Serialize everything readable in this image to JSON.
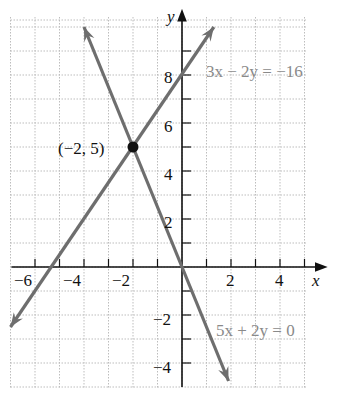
{
  "chart_data": {
    "type": "line",
    "title": "",
    "xlabel": "x",
    "ylabel": "y",
    "xlim": [
      -7,
      5
    ],
    "ylim": [
      -5,
      10
    ],
    "grid": true,
    "x_ticks": [
      -6,
      -4,
      -2,
      2,
      4
    ],
    "y_ticks": [
      -4,
      -2,
      2,
      4,
      6,
      8
    ],
    "series": [
      {
        "name": "3x − 2y = −16",
        "equation": "y = 1.5x + 8",
        "points": [
          [
            -7,
            -2.5
          ],
          [
            1.3,
            10
          ]
        ]
      },
      {
        "name": "5x + 2y = 0",
        "equation": "y = -2.5x",
        "points": [
          [
            -4,
            10
          ],
          [
            1.9,
            -4.75
          ]
        ]
      }
    ],
    "annotations": [
      {
        "text": "(−2, 5)",
        "x": -2,
        "y": 5,
        "marker": "point"
      }
    ]
  },
  "labels": {
    "x_axis": "x",
    "y_axis": "y",
    "eq1": "3x − 2y = −16",
    "eq2": "5x + 2y = 0",
    "point": "(−2, 5)",
    "tick_x": [
      "−6",
      "−4",
      "−2",
      "2",
      "4"
    ],
    "tick_y": [
      "8",
      "6",
      "4",
      "2",
      "−2",
      "−4"
    ]
  }
}
